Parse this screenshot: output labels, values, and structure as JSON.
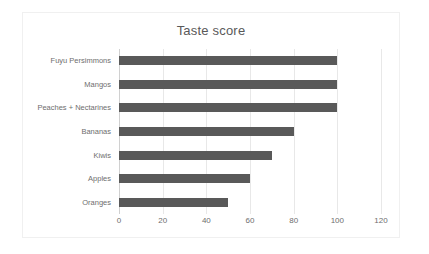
{
  "chart_data": {
    "type": "bar",
    "orientation": "horizontal",
    "title": "Taste score",
    "xlabel": "",
    "ylabel": "",
    "categories": [
      "Fuyu Persimmons",
      "Mangos",
      "Peaches + Nectarines",
      "Bananas",
      "Kiwis",
      "Apples",
      "Oranges"
    ],
    "values": [
      100,
      100,
      100,
      80,
      70,
      60,
      50
    ],
    "xlim": [
      0,
      120
    ],
    "xticks": [
      0,
      20,
      40,
      60,
      80,
      100,
      120
    ],
    "xtick_labels": [
      "0",
      "20",
      "40",
      "60",
      "80",
      "100",
      "120"
    ],
    "grid": true,
    "legend": false,
    "bar_color": "#595959",
    "gridline_color": "#e8e8e8",
    "text_color": "#6e6e6e",
    "title_color": "#595959",
    "plot_background": "#ffffff",
    "border_color": "#f0f0f0"
  }
}
